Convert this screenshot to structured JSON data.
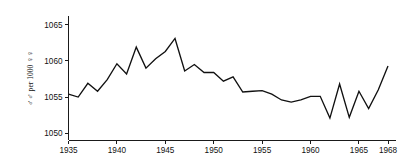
{
  "chart_data": {
    "type": "line",
    "title": "",
    "subtitle": "",
    "xlabel": "",
    "ylabel": "♂♂ per 1000 ♀♀",
    "ylabel_parts": {
      "male_symbols": "♂♂",
      "middle": " per 1000 ",
      "female_symbols": "♀♀"
    },
    "xlim": [
      1935,
      1968
    ],
    "ylim": [
      1049,
      1066.2
    ],
    "grid": false,
    "legend": false,
    "legend_position": "none",
    "x_ticks": [
      1935,
      1940,
      1945,
      1950,
      1955,
      1960,
      1965,
      1968
    ],
    "x_tick_labels": [
      "1935",
      "1940",
      "1945",
      "1950",
      "1955",
      "1960",
      "1965",
      "1968"
    ],
    "y_ticks": [
      1050,
      1055,
      1060,
      1065
    ],
    "y_tick_labels": [
      "1050",
      "1055",
      "1060",
      "1065"
    ],
    "line_color": "#111111",
    "axis_color": "#1a1a1a",
    "background_color": "#ffffff",
    "series": [
      {
        "name": "sex ratio at birth",
        "x": [
          1935,
          1936,
          1937,
          1938,
          1939,
          1940,
          1941,
          1942,
          1943,
          1944,
          1945,
          1946,
          1947,
          1948,
          1949,
          1950,
          1951,
          1952,
          1953,
          1954,
          1955,
          1956,
          1957,
          1958,
          1959,
          1960,
          1961,
          1962,
          1963,
          1964,
          1965,
          1966,
          1967,
          1968
        ],
        "values": [
          1055.4,
          1055.0,
          1056.9,
          1055.8,
          1057.4,
          1059.6,
          1058.2,
          1061.9,
          1059.0,
          1060.3,
          1061.3,
          1063.1,
          1058.6,
          1059.5,
          1058.4,
          1058.4,
          1057.2,
          1057.8,
          1055.7,
          1055.8,
          1055.9,
          1055.4,
          1054.6,
          1054.3,
          1054.6,
          1055.1,
          1055.1,
          1052.1,
          1056.8,
          1052.2,
          1055.8,
          1053.4,
          1056.0,
          1059.3
        ]
      }
    ]
  }
}
